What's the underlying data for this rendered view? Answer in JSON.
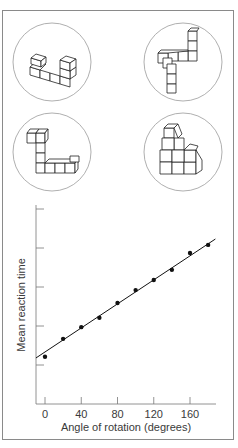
{
  "figure": {
    "stimuli": [
      {
        "id": "stimulus-top-left"
      },
      {
        "id": "stimulus-top-right"
      },
      {
        "id": "stimulus-bottom-left"
      },
      {
        "id": "stimulus-bottom-right"
      }
    ]
  },
  "chart_data": {
    "type": "scatter",
    "title": "",
    "xlabel": "Angle of rotation (degrees)",
    "ylabel": "Mean reaction time",
    "x_ticks": [
      0,
      40,
      80,
      120,
      160
    ],
    "x_tick_labels": [
      "0",
      "40",
      "80",
      "120",
      "160"
    ],
    "y_ticks_count": 5,
    "y_tick_labels": [],
    "xlim": [
      -8,
      190
    ],
    "ylim": [
      0,
      5
    ],
    "grid": false,
    "legend": null,
    "x": [
      0,
      20,
      40,
      60,
      80,
      100,
      120,
      140,
      160,
      180
    ],
    "y": [
      1.21,
      1.67,
      1.97,
      2.21,
      2.59,
      2.92,
      3.18,
      3.44,
      3.87,
      4.08
    ],
    "series": [
      {
        "name": "observed",
        "type": "scatter",
        "x": [
          0,
          20,
          40,
          60,
          80,
          100,
          120,
          140,
          160,
          180
        ],
        "values": [
          1.21,
          1.67,
          1.97,
          2.21,
          2.59,
          2.92,
          3.18,
          3.44,
          3.87,
          4.08
        ]
      },
      {
        "name": "linear fit",
        "type": "line",
        "x": [
          -10,
          188
        ],
        "values": [
          1.18,
          4.23
        ]
      }
    ],
    "annotations": [
      "y-axis has unlabeled tick marks"
    ]
  }
}
